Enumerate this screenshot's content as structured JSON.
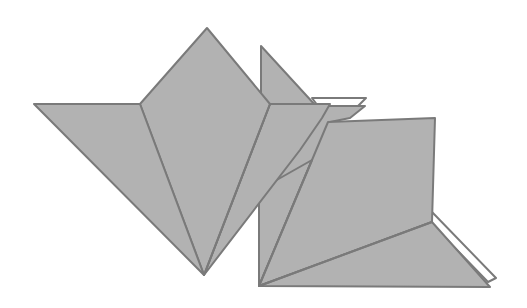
{
  "figure": {
    "colors": {
      "face": "#b2b2b2",
      "stroke": "#7a7a7a",
      "background": "#ffffff",
      "paper_edge": "#ffffff"
    },
    "parts": [
      {
        "name": "left-flower-left-petal",
        "points": "34,104 140,104 204,275"
      },
      {
        "name": "left-flower-center-diamond",
        "points": "140,104 207,28 270,104 204,275"
      },
      {
        "name": "left-flower-right-petal",
        "points": "270,104 325,104 204,275"
      },
      {
        "name": "rear-flap-top",
        "points": "261,46 261,105 320,105"
      },
      {
        "name": "right-panel",
        "points": "328,122 435,118 432,222 259,286"
      },
      {
        "name": "bottom-triangle",
        "points": "259,286 432,222 490,287"
      }
    ]
  }
}
